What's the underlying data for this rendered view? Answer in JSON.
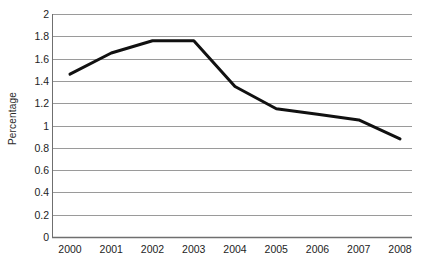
{
  "chart_data": {
    "type": "line",
    "title": "",
    "xlabel": "",
    "ylabel": "Percentage",
    "categories": [
      "2000",
      "2001",
      "2002",
      "2003",
      "2004",
      "2005",
      "2006",
      "2007",
      "2008"
    ],
    "values": [
      1.46,
      1.65,
      1.76,
      1.76,
      1.35,
      1.15,
      1.1,
      1.05,
      0.88
    ],
    "series": [
      {
        "name": "Percentage",
        "values": [
          1.46,
          1.65,
          1.76,
          1.76,
          1.35,
          1.15,
          1.1,
          1.05,
          0.88
        ]
      }
    ],
    "ylim": [
      0,
      2
    ],
    "yticks": [
      0,
      0.2,
      0.4,
      0.6,
      0.8,
      1,
      1.2,
      1.4,
      1.6,
      1.8,
      2
    ],
    "ytick_labels": [
      "0",
      "0.2",
      "0.4",
      "0.6",
      "0.8",
      "1",
      "1.2",
      "1.4",
      "1.6",
      "1.8",
      "2"
    ],
    "grid": true,
    "grid_axis": "y",
    "legend": "none",
    "line_color": "#111111",
    "grid_color": "#9a9a9a",
    "axis_color": "#6f6f6f",
    "background_color": "#ffffff",
    "line_width": 3
  }
}
